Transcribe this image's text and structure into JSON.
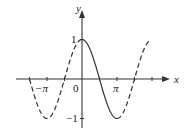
{
  "chart_data": {
    "type": "line",
    "title": "",
    "function": "y = cos x",
    "xlabel": "x",
    "ylabel": "y",
    "x_ticks": [
      {
        "value": -3.1416,
        "label": "−π"
      },
      {
        "value": 3.1416,
        "label": "π"
      }
    ],
    "origin_label": "0",
    "y_ticks": [
      {
        "value": 1,
        "label": "1"
      },
      {
        "value": -1,
        "label": "−1"
      }
    ],
    "xlim": [
      -4.71,
      6.28
    ],
    "ylim": [
      -1,
      1
    ],
    "grid": false,
    "series": [
      {
        "name": "cos x (restricted, 0 ≤ x ≤ π)",
        "style": "solid",
        "x_range": [
          0,
          3.1416
        ]
      },
      {
        "name": "cos x (rest of curve)",
        "style": "dashed",
        "x_range": [
          [
            -4.71,
            0
          ],
          [
            3.1416,
            6.28
          ]
        ]
      }
    ],
    "key_points": [
      {
        "x": -3.1416,
        "y": -1
      },
      {
        "x": 0,
        "y": 1
      },
      {
        "x": 3.1416,
        "y": -1
      }
    ]
  },
  "labels": {
    "x_axis": "x",
    "y_axis": "y",
    "origin": "0",
    "neg_pi": "−π",
    "pi": "π",
    "y_one": "1",
    "y_neg_one": "−1"
  }
}
